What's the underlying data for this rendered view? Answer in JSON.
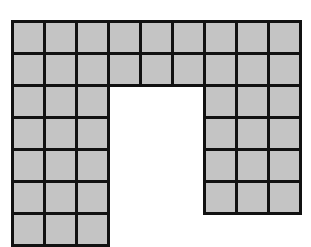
{
  "diagram": {
    "title": "",
    "colors": {
      "tile_fill": "#c4c4c4",
      "tile_border": "#111111",
      "background": "#ffffff"
    },
    "grid": {
      "origin_x": 11,
      "origin_y": 20,
      "cell_size": 32,
      "columns": 9,
      "rows": 7,
      "filled": [
        [
          1,
          1,
          1,
          1,
          1,
          1,
          1,
          1,
          1
        ],
        [
          1,
          1,
          1,
          1,
          1,
          1,
          1,
          1,
          1
        ],
        [
          1,
          1,
          1,
          0,
          0,
          0,
          1,
          1,
          1
        ],
        [
          1,
          1,
          1,
          0,
          0,
          0,
          1,
          1,
          1
        ],
        [
          1,
          1,
          1,
          0,
          0,
          0,
          1,
          1,
          1
        ],
        [
          1,
          1,
          1,
          0,
          0,
          0,
          1,
          1,
          1
        ],
        [
          1,
          1,
          1,
          0,
          0,
          0,
          0,
          0,
          0
        ]
      ]
    }
  }
}
